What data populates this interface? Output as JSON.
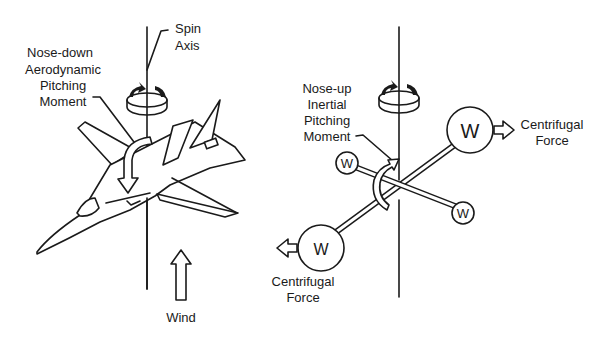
{
  "left_panel": {
    "spin_axis_label": [
      "Spin",
      "Axis"
    ],
    "pitching_moment_label": [
      "Nose-down",
      "Aerodynamic",
      "Pitching",
      "Moment"
    ],
    "wind_label": "Wind"
  },
  "right_panel": {
    "pitching_moment_label": [
      "Nose-up",
      "Inertial",
      "Pitching",
      "Moment"
    ],
    "weight_symbol": "W",
    "centrifugal_force_right": [
      "Centrifugal",
      "Force"
    ],
    "centrifugal_force_left": [
      "Centrifugal",
      "Force"
    ]
  },
  "colors": {
    "line": "#1a1a1a",
    "background": "#ffffff"
  }
}
